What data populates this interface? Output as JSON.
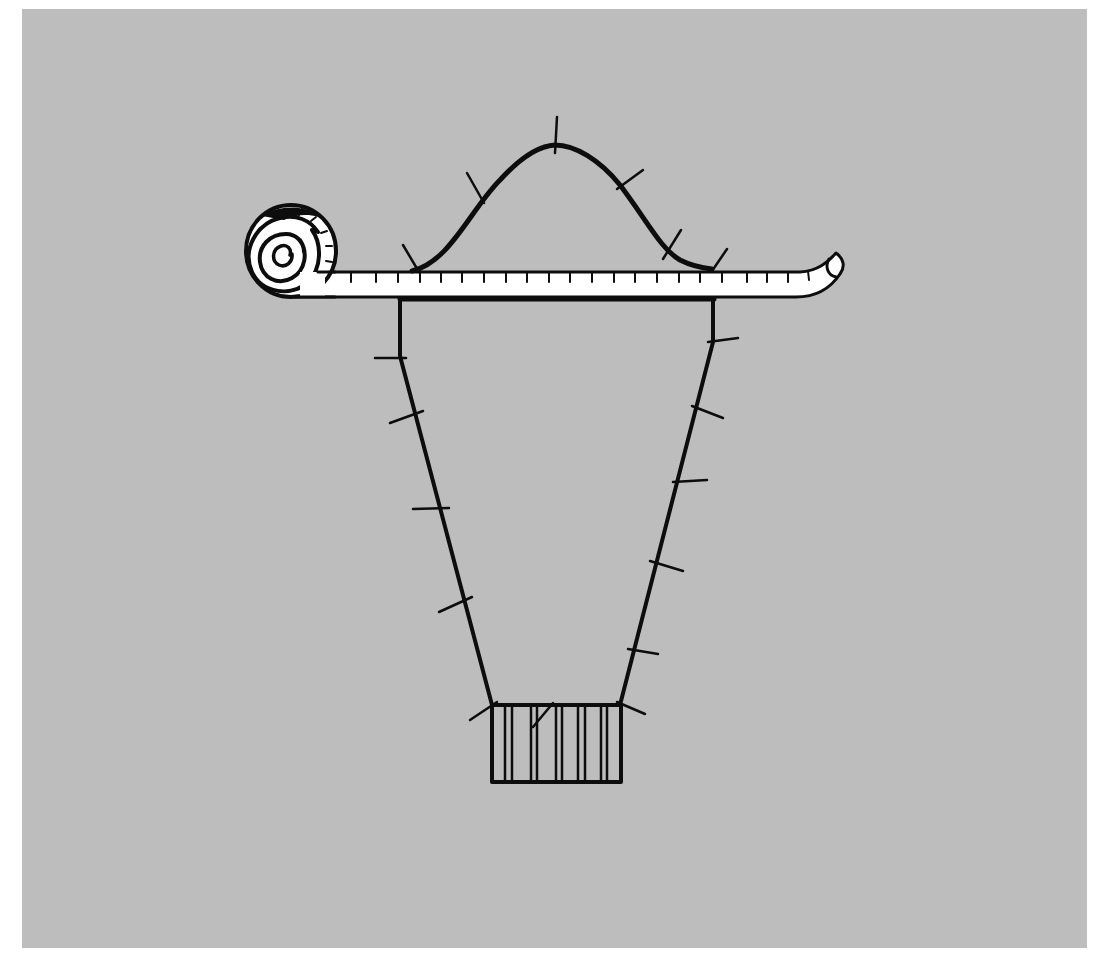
{
  "illustration": {
    "description": "Sewing pattern for a sleeve pinned along its edges, with a tape measure laid across the top",
    "colors": {
      "background_panel": "#bdbdbd",
      "page": "#ffffff",
      "ink": "#0d0d0d",
      "tape_fill": "#ffffff"
    },
    "elements": {
      "tape_measure": "tape-measure",
      "sleeve_cap": "sleeve-cap-curve",
      "sleeve_body": "sleeve-pattern-piece",
      "cuff": "cuff-band",
      "pins": "sewing-pins"
    },
    "pin_count": 19
  }
}
